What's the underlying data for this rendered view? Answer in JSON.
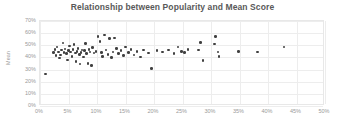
{
  "chart_data": {
    "type": "scatter",
    "title": "Relationship between Popularity and Mean Score",
    "xlabel": "",
    "ylabel": "Mean",
    "xlim": [
      0,
      50
    ],
    "ylim": [
      0,
      70
    ],
    "x_tick_labels": [
      "0%",
      "5%",
      "10%",
      "15%",
      "20%",
      "25%",
      "30%",
      "35%",
      "40%",
      "45%",
      "50%"
    ],
    "x_ticks": [
      0,
      5,
      10,
      15,
      20,
      25,
      30,
      35,
      40,
      45,
      50
    ],
    "y_tick_labels": [
      "0%",
      "10%",
      "20%",
      "30%",
      "40%",
      "50%",
      "60%",
      "70%"
    ],
    "y_ticks": [
      0,
      10,
      20,
      30,
      40,
      50,
      60,
      70
    ],
    "grid": true,
    "legend": false,
    "marker_color": "#404040",
    "points": [
      [
        1.0,
        26.5
      ],
      [
        2.4,
        44.0
      ],
      [
        2.6,
        46.5
      ],
      [
        2.8,
        41.5
      ],
      [
        3.0,
        48.5
      ],
      [
        3.2,
        44.5
      ],
      [
        3.4,
        39.5
      ],
      [
        3.6,
        42.0
      ],
      [
        3.8,
        46.0
      ],
      [
        4.0,
        52.0
      ],
      [
        4.2,
        44.0
      ],
      [
        4.4,
        47.0
      ],
      [
        4.6,
        43.0
      ],
      [
        4.8,
        38.0
      ],
      [
        5.0,
        45.5
      ],
      [
        5.2,
        49.5
      ],
      [
        5.4,
        44.5
      ],
      [
        5.6,
        41.0
      ],
      [
        5.8,
        46.5
      ],
      [
        6.0,
        50.5
      ],
      [
        6.2,
        43.5
      ],
      [
        6.3,
        36.5
      ],
      [
        6.5,
        45.0
      ],
      [
        6.7,
        47.5
      ],
      [
        6.9,
        42.5
      ],
      [
        7.0,
        34.5
      ],
      [
        7.2,
        44.0
      ],
      [
        7.4,
        46.0
      ],
      [
        7.6,
        40.5
      ],
      [
        7.8,
        45.5
      ],
      [
        8.0,
        51.5
      ],
      [
        8.2,
        43.0
      ],
      [
        8.4,
        35.0
      ],
      [
        8.6,
        46.5
      ],
      [
        8.8,
        44.5
      ],
      [
        9.0,
        33.5
      ],
      [
        9.2,
        48.0
      ],
      [
        9.5,
        43.5
      ],
      [
        9.8,
        45.0
      ],
      [
        10.2,
        57.0
      ],
      [
        10.5,
        53.0
      ],
      [
        10.8,
        44.0
      ],
      [
        11.0,
        41.0
      ],
      [
        11.3,
        58.5
      ],
      [
        11.6,
        46.0
      ],
      [
        11.9,
        42.5
      ],
      [
        12.2,
        55.5
      ],
      [
        12.5,
        40.0
      ],
      [
        12.8,
        44.5
      ],
      [
        13.1,
        56.0
      ],
      [
        13.4,
        47.5
      ],
      [
        13.8,
        43.0
      ],
      [
        14.2,
        45.5
      ],
      [
        14.6,
        41.5
      ],
      [
        15.0,
        48.5
      ],
      [
        15.5,
        44.0
      ],
      [
        16.0,
        46.5
      ],
      [
        16.5,
        42.0
      ],
      [
        17.0,
        45.0
      ],
      [
        17.6,
        40.5
      ],
      [
        18.2,
        46.0
      ],
      [
        19.0,
        43.5
      ],
      [
        19.6,
        31.0
      ],
      [
        20.5,
        45.5
      ],
      [
        21.5,
        44.5
      ],
      [
        22.5,
        46.0
      ],
      [
        23.5,
        43.0
      ],
      [
        24.2,
        48.5
      ],
      [
        24.8,
        45.0
      ],
      [
        25.4,
        44.0
      ],
      [
        26.0,
        46.5
      ],
      [
        27.8,
        46.0
      ],
      [
        28.2,
        52.5
      ],
      [
        28.6,
        37.5
      ],
      [
        30.6,
        51.0
      ],
      [
        30.8,
        57.0
      ],
      [
        31.2,
        44.5
      ],
      [
        31.4,
        41.0
      ],
      [
        34.8,
        45.0
      ],
      [
        38.2,
        44.5
      ],
      [
        42.8,
        48.5
      ]
    ]
  }
}
